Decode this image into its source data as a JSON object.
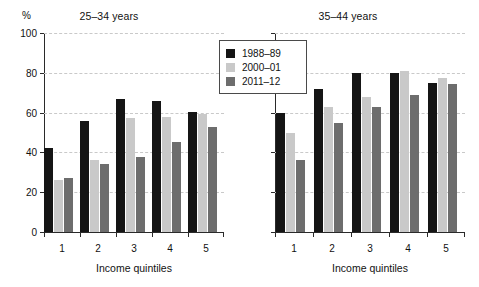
{
  "chart_data": [
    {
      "type": "bar",
      "title": "25–34 years",
      "xlabel": "Income quintiles",
      "ylabel": "%",
      "categories": [
        "1",
        "2",
        "3",
        "4",
        "5"
      ],
      "ylim": [
        0,
        100
      ],
      "yticks": [
        0,
        20,
        40,
        60,
        80,
        100
      ],
      "grid": true,
      "legend_position": "top-right-between-panels",
      "series": [
        {
          "name": "1988–89",
          "color": "#151515",
          "values": [
            42,
            56,
            67,
            66,
            60.5
          ]
        },
        {
          "name": "2000–01",
          "color": "#c9c9c9",
          "values": [
            26,
            36,
            57.5,
            58,
            59.5
          ]
        },
        {
          "name": "2011–12",
          "color": "#6d6d6d",
          "values": [
            27,
            34,
            37.5,
            45,
            53
          ]
        }
      ]
    },
    {
      "type": "bar",
      "title": "35–44 years",
      "xlabel": "Income quintiles",
      "ylabel": "",
      "categories": [
        "1",
        "2",
        "3",
        "4",
        "5"
      ],
      "ylim": [
        0,
        100
      ],
      "yticks": [
        0,
        20,
        40,
        60,
        80,
        100
      ],
      "grid": true,
      "series": [
        {
          "name": "1988–89",
          "color": "#151515",
          "values": [
            60,
            72,
            80,
            80,
            75
          ]
        },
        {
          "name": "2000–01",
          "color": "#c9c9c9",
          "values": [
            50,
            63,
            68,
            81,
            77.5
          ]
        },
        {
          "name": "2011–12",
          "color": "#6d6d6d",
          "values": [
            36,
            55,
            63,
            69,
            74.5
          ]
        }
      ]
    }
  ],
  "panels": [
    {
      "title": "25–34 years",
      "percent_label": "%",
      "xaxis_title": "Income quintiles",
      "ytick_labels": [
        "0",
        "20",
        "40",
        "60",
        "80",
        "100"
      ],
      "xtick_labels": [
        "1",
        "2",
        "3",
        "4",
        "5"
      ]
    },
    {
      "title": "35–44 years",
      "percent_label": "",
      "xaxis_title": "Income quintiles",
      "ytick_labels": [
        "",
        "",
        "",
        "",
        "",
        ""
      ],
      "xtick_labels": [
        "1",
        "2",
        "3",
        "4",
        "5"
      ]
    }
  ],
  "legend": {
    "items": [
      {
        "label": "1988–89",
        "color": "#151515"
      },
      {
        "label": "2000–01",
        "color": "#c9c9c9"
      },
      {
        "label": "2011–12",
        "color": "#6d6d6d"
      }
    ]
  },
  "colors": {
    "series_1988_89": "#151515",
    "series_2000_01": "#c9c9c9",
    "series_2011_12": "#6d6d6d",
    "axis": "#2a2a2a",
    "gridline": "#c9c9c9",
    "background": "#ffffff",
    "text": "#111111"
  }
}
